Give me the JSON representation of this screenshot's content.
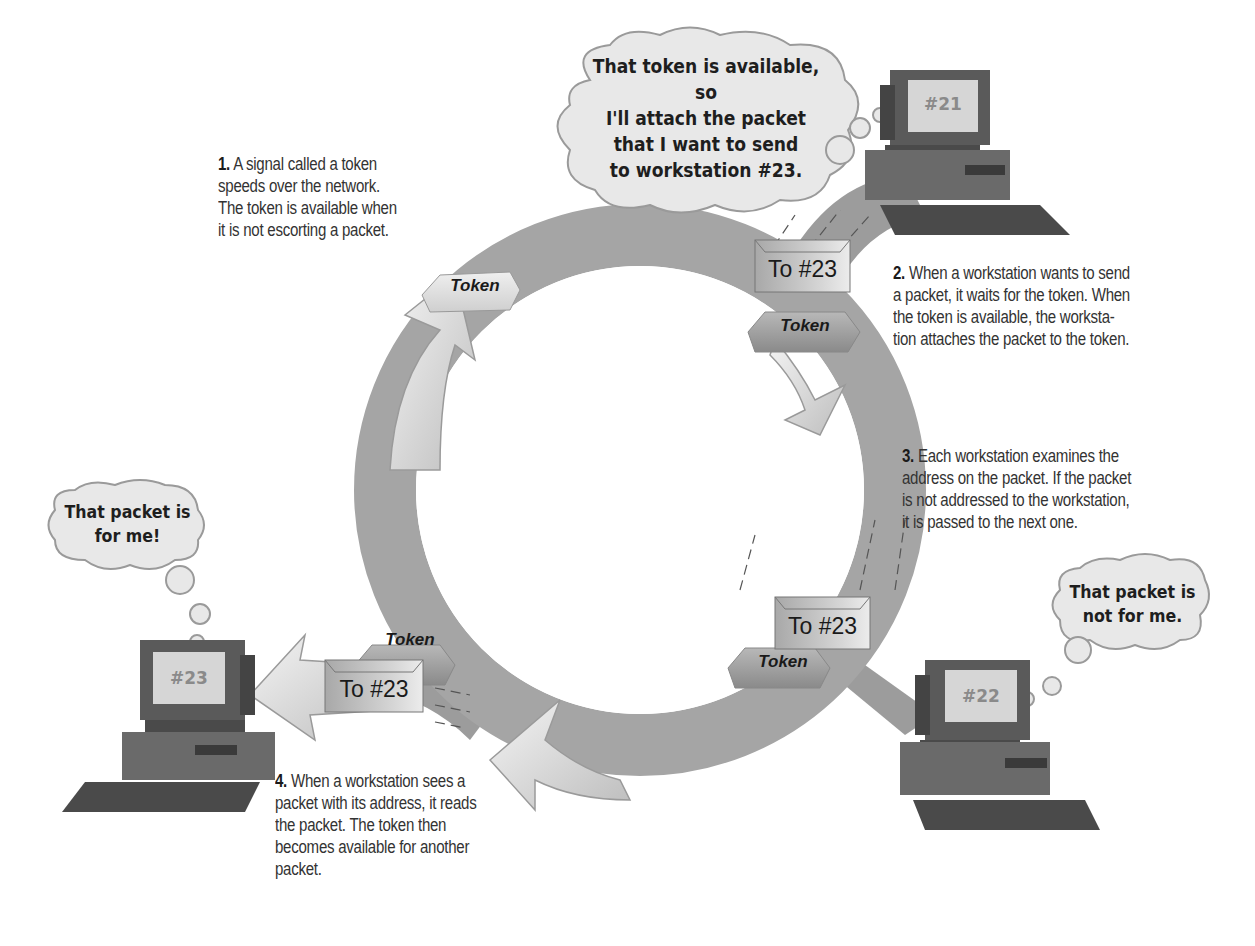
{
  "diagram": {
    "type": "token-ring-network",
    "colors": {
      "ring": "#a9a9a9",
      "ring_arrow": "#e2e2e2",
      "bubble_fill": "#e8e8e8",
      "bubble_stroke": "#9a9a9a",
      "envelope": "#c4c4c4",
      "token_light": "#dcdcdc",
      "token_dark": "#9e9e9e",
      "computer": "#555555",
      "screen": "#d8d8d8"
    },
    "steps": [
      {
        "number": "1.",
        "text_lines": [
          "A signal called a token",
          "speeds over the network.",
          "The token is available when",
          "it is not escorting a packet."
        ]
      },
      {
        "number": "2.",
        "text_lines": [
          "When a workstation wants to send",
          "a packet, it waits for the token. When",
          "the token is available, the worksta-",
          "tion attaches the packet to the token."
        ]
      },
      {
        "number": "3.",
        "text_lines": [
          "Each workstation examines the",
          "address on the packet. If the packet",
          "is not addressed to the workstation,",
          "it is passed to the next one."
        ]
      },
      {
        "number": "4.",
        "text_lines": [
          "When a workstation sees a",
          "packet with its address, it reads",
          "the packet. The token then",
          "becomes available for another",
          "packet."
        ]
      }
    ],
    "bubbles": {
      "ws21": [
        "That token is available, so",
        "I'll attach the packet",
        "that I want to send",
        "to workstation #23."
      ],
      "ws22": [
        "That packet is",
        "not for me."
      ],
      "ws23": [
        "That packet is",
        "for me!"
      ]
    },
    "workstations": {
      "ws21": "#21",
      "ws22": "#22",
      "ws23": "#23"
    },
    "tokens": {
      "free": "Token",
      "with_packet_21": "Token",
      "with_packet_22": "Token",
      "with_packet_23": "Token"
    },
    "envelopes": {
      "at_21": "To #23",
      "at_22": "To #23",
      "at_23": "To #23"
    }
  }
}
